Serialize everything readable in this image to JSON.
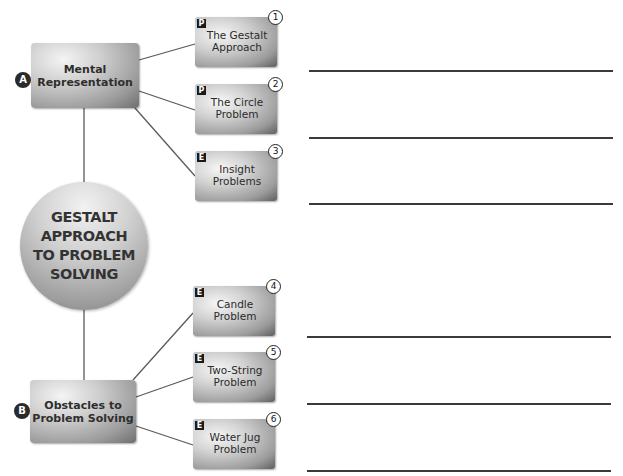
{
  "title": "GESTALT APPROACH TO PROBLEM SOLVING",
  "central_node": {
    "lines": [
      "GESTALT",
      "APPROACH",
      "TO PROBLEM",
      "SOLVING"
    ]
  },
  "branches": [
    {
      "letter": "A",
      "label_lines": [
        "Mental",
        "Representation"
      ],
      "items": [
        {
          "number": "1",
          "type": "P",
          "label_lines": [
            "The Gestalt",
            "Approach"
          ]
        },
        {
          "number": "2",
          "type": "P",
          "label_lines": [
            "The Circle",
            "Problem"
          ]
        },
        {
          "number": "3",
          "type": "E",
          "label_lines": [
            "Insight",
            "Problems"
          ]
        }
      ]
    },
    {
      "letter": "B",
      "label_lines": [
        "Obstacles to",
        "Problem Solving"
      ],
      "items": [
        {
          "number": "4",
          "type": "E",
          "label_lines": [
            "Candle",
            "Problem"
          ]
        },
        {
          "number": "5",
          "type": "E",
          "label_lines": [
            "Two-String",
            "Problem"
          ]
        },
        {
          "number": "6",
          "type": "E",
          "label_lines": [
            "Water Jug",
            "Problem"
          ]
        }
      ]
    }
  ],
  "answer_lines_count": 6,
  "colors": {
    "badge": "#2b2b2b",
    "line": "#3a3a3a",
    "text": "#2e2e2e"
  }
}
